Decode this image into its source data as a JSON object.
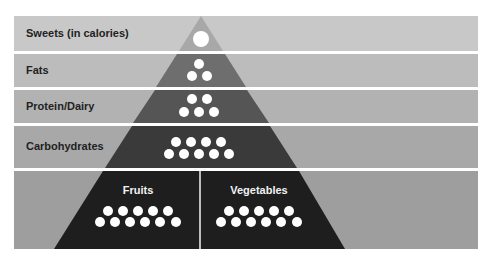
{
  "tiers": [
    {
      "label": "Sweets (in calories)",
      "servings": 1,
      "row_color": "#c8c8c8",
      "tri_color": "#a8a8a8"
    },
    {
      "label": "Fats",
      "servings": 3,
      "row_color": "#bcbcbc",
      "tri_color": "#6e6e6e"
    },
    {
      "label": "Protein/Dairy",
      "servings": 5,
      "row_color": "#b2b2b2",
      "tri_color": "#555555"
    },
    {
      "label": "Carbohydrates",
      "servings": 9,
      "row_color": "#a8a8a8",
      "tri_color": "#3a3a3a"
    },
    {
      "label": "",
      "servings": 22,
      "row_color": "#9e9e9e",
      "tri_color": "#1e1e1e",
      "sub_groups": [
        {
          "label": "Fruits",
          "servings": 11
        },
        {
          "label": "Vegetables",
          "servings": 11
        }
      ]
    }
  ],
  "dot_color": "#ffffff",
  "divider_color": "#ffffff"
}
